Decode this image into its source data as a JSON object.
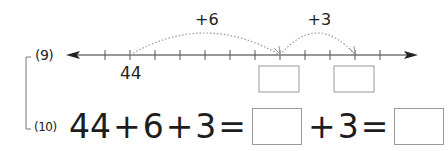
{
  "problems": [
    {
      "number": "(9)",
      "type": "number-line",
      "start_label": "44",
      "start_value": 44,
      "tick_interval": 1,
      "ticks_before_start": 1,
      "ticks_after_start": 10,
      "jumps": [
        {
          "label": "+6",
          "from": 44,
          "to": 50
        },
        {
          "label": "+3",
          "from": 50,
          "to": 53
        }
      ],
      "answer_boxes_at": [
        50,
        53
      ]
    },
    {
      "number": "(10)",
      "type": "equation",
      "tokens": [
        "44",
        "+",
        "6",
        "+",
        "3",
        "=",
        "[box]",
        "+",
        "3",
        "=",
        "[box]"
      ],
      "left": {
        "a": "44",
        "op1": "+",
        "b": "6",
        "op2": "+",
        "c": "3",
        "eq": "="
      },
      "middle": {
        "op": "+",
        "c": "3",
        "eq": "="
      }
    }
  ],
  "colors": {
    "line": "#333333",
    "arc": "#9a9a9a",
    "box_border": "#9a9a9a",
    "bracket": "#777777"
  }
}
